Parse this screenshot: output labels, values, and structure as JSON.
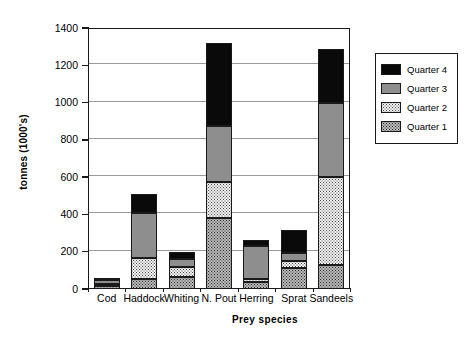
{
  "chart_data": {
    "type": "bar",
    "subtype": "stacked",
    "title": "",
    "xlabel": "Prey species",
    "ylabel": "tonnes (1000's)",
    "ylim": [
      0,
      1400
    ],
    "yticks": [
      0,
      200,
      400,
      600,
      800,
      1000,
      1200,
      1400
    ],
    "ytick_labels": [
      "0",
      "200",
      "400",
      "600",
      "800",
      "1000",
      "1200",
      "1400"
    ],
    "grid": true,
    "grid_axis": "y",
    "legend_position": "right",
    "categories": [
      "Cod",
      "Haddock",
      "Whiting",
      "N. Pout",
      "Herring",
      "Sprat",
      "Sandeels"
    ],
    "series": [
      {
        "name": "Quarter 1",
        "color": "#b9b9b9",
        "pattern": "dark-dots",
        "values": [
          18,
          55,
          65,
          380,
          35,
          115,
          130
        ]
      },
      {
        "name": "Quarter 2",
        "color": "#f2f2f2",
        "pattern": "light-dots",
        "values": [
          8,
          110,
          55,
          195,
          20,
          35,
          470
        ]
      },
      {
        "name": "Quarter 3",
        "color": "#8e8e8e",
        "pattern": "solid",
        "values": [
          20,
          245,
          43,
          300,
          177,
          45,
          400
        ]
      },
      {
        "name": "Quarter 4",
        "color": "#0a0a0a",
        "pattern": "solid",
        "values": [
          9,
          102,
          37,
          445,
          33,
          120,
          285
        ]
      }
    ],
    "totals": [
      55,
      512,
      200,
      1320,
      265,
      315,
      1285
    ],
    "stack_tops": {
      "Cod": {
        "q1": 18,
        "q2": 26,
        "q3": 46,
        "q4": 55
      },
      "Haddock": {
        "q1": 55,
        "q2": 165,
        "q3": 410,
        "q4": 512
      },
      "Whiting": {
        "q1": 65,
        "q2": 120,
        "q3": 163,
        "q4": 200
      },
      "N. Pout": {
        "q1": 380,
        "q2": 575,
        "q3": 875,
        "q4": 1320
      },
      "Herring": {
        "q1": 35,
        "q2": 55,
        "q3": 232,
        "q4": 265
      },
      "Sprat": {
        "q1": 115,
        "q2": 150,
        "q3": 195,
        "q4": 315
      },
      "Sandeels": {
        "q1": 130,
        "q2": 600,
        "q3": 1000,
        "q4": 1285
      }
    }
  },
  "legend": {
    "items": [
      {
        "label": "Quarter 4",
        "swatch": "q4"
      },
      {
        "label": "Quarter 3",
        "swatch": "q3"
      },
      {
        "label": "Quarter 2",
        "swatch": "q2"
      },
      {
        "label": "Quarter 1",
        "swatch": "q1"
      }
    ]
  }
}
